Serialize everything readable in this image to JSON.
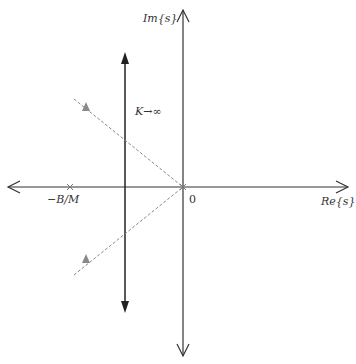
{
  "diagram": {
    "type": "root-locus",
    "labels": {
      "imag_axis": "Im{s}",
      "real_axis": "Re{s}",
      "origin": "0",
      "pole_left": "−B/M",
      "gain_annotation": "K→∞"
    },
    "poles": [
      {
        "name": "pole-origin",
        "value": "0",
        "marker": "x"
      },
      {
        "name": "pole-left",
        "value": "−B/M",
        "marker": "x"
      }
    ],
    "zeros_or_markers": [
      {
        "name": "upper-triangle",
        "marker": "triangle"
      },
      {
        "name": "lower-triangle",
        "marker": "triangle"
      }
    ],
    "branches": [
      {
        "name": "upward-asymptote",
        "direction": "up"
      },
      {
        "name": "downward-asymptote",
        "direction": "down"
      }
    ],
    "colors": {
      "axis": "#333333",
      "branch": "#222222",
      "dashed": "#888888",
      "triangle": "#8a8a8a",
      "marker": "#777777"
    }
  }
}
